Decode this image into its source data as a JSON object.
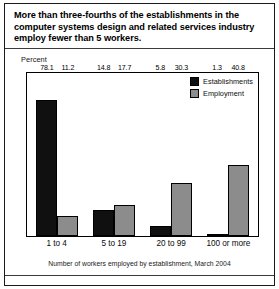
{
  "title": "More than three-fourths of the establishments in the computer systems design and related services industry employ fewer than 5 workers.",
  "axis_caption": "Percent",
  "footer_caption": "Number of workers employed by establishment, March 2004",
  "colors": {
    "establishments": "#101010",
    "employment": "#8c8c8c",
    "frame": "#000000",
    "background": "#ffffff"
  },
  "chart_data": {
    "type": "bar",
    "title": "More than three-fourths of the establishments in the computer systems design and related services industry employ fewer than 5 workers.",
    "xlabel": "Number of workers employed by establishment, March 2004",
    "ylabel": "Percent",
    "ylim": [
      0,
      82
    ],
    "grid": false,
    "legend_position": "top-right",
    "categories": [
      "1 to 4",
      "5 to 19",
      "20 to 99",
      "100 or more"
    ],
    "series": [
      {
        "name": "Establishments",
        "color": "#101010",
        "values": [
          78.1,
          14.8,
          5.8,
          1.3
        ],
        "labels": [
          "78.1",
          "14.8",
          "5.8",
          "1.3"
        ]
      },
      {
        "name": "Employment",
        "color": "#8c8c8c",
        "values": [
          11.2,
          17.7,
          30.3,
          40.8
        ],
        "labels": [
          "11.2",
          "17.7",
          "30.3",
          "40.8"
        ]
      }
    ]
  }
}
